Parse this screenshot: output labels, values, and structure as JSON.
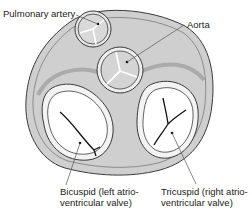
{
  "figure": {
    "labels": {
      "pulmonary": "Pulmonary artery",
      "aorta": "Aorta",
      "bicuspid_line1": "Bicuspid (left atrio-",
      "bicuspid_line2": "ventricular valve)",
      "tricuspid_line1": "Tricuspid (right atrio-",
      "tricuspid_line2": "ventricular valve)"
    },
    "colors": {
      "tissue": "#c9c9c9",
      "tissue_light": "#dcdcdc",
      "outline": "#3a3a3a",
      "valve_lumen": "#ffffff",
      "leaflet": "#e2e2e2",
      "leader": "#555555"
    }
  }
}
